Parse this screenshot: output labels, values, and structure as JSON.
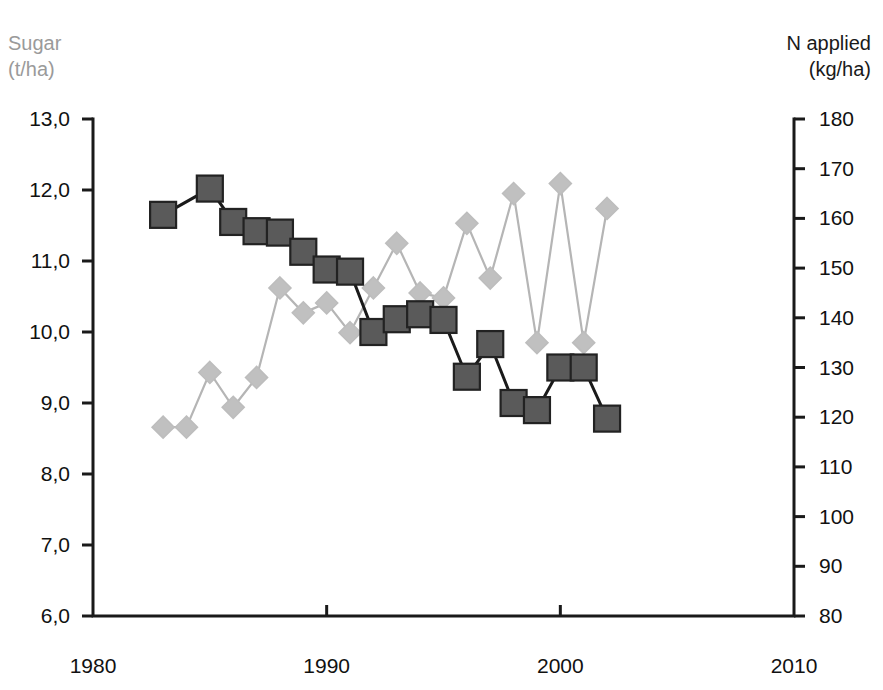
{
  "chart_data": {
    "type": "line",
    "title": "",
    "xlabel": "",
    "xlim": [
      1980,
      2010
    ],
    "x_ticks": [
      "1980",
      "1990",
      "2000",
      "2010"
    ],
    "x_tick_values": [
      1980,
      1990,
      2000,
      2010
    ],
    "grid": false,
    "legend": "none",
    "axes": [
      {
        "id": "left",
        "label_line1": "Sugar",
        "label_line2": "(t/ha)",
        "label_color": "#9a9a9a",
        "ylim": [
          6.0,
          13.0
        ],
        "ticks": [
          "6,0",
          "7,0",
          "8,0",
          "9,0",
          "10,0",
          "11,0",
          "12,0",
          "13,0"
        ],
        "tick_values": [
          6.0,
          7.0,
          8.0,
          9.0,
          10.0,
          11.0,
          12.0,
          13.0
        ]
      },
      {
        "id": "right",
        "label_line1": "N applied",
        "label_line2": "(kg/ha)",
        "label_color": "#1a1a1a",
        "ylim": [
          80,
          180
        ],
        "ticks": [
          "80",
          "90",
          "100",
          "110",
          "120",
          "130",
          "140",
          "150",
          "160",
          "170",
          "180"
        ],
        "tick_values": [
          80,
          90,
          100,
          110,
          120,
          130,
          140,
          150,
          160,
          170,
          180
        ]
      }
    ],
    "series": [
      {
        "name": "Sugar",
        "axis": "left",
        "marker": "square",
        "marker_color": "#5a5a5a",
        "marker_edge": "#222222",
        "line_color": "#1a1a1a",
        "x": [
          1983,
          1985,
          1986,
          1987,
          1988,
          1989,
          1990,
          1991,
          1992,
          1993,
          1994,
          1995,
          1996,
          1997,
          1998,
          1999,
          2000,
          2001,
          2002
        ],
        "values": [
          11.65,
          12.02,
          11.55,
          11.42,
          11.4,
          11.13,
          10.88,
          10.85,
          10.0,
          10.18,
          10.25,
          10.17,
          9.37,
          9.83,
          9.0,
          8.9,
          9.5,
          9.5,
          8.78
        ]
      },
      {
        "name": "N applied",
        "axis": "right",
        "marker": "diamond",
        "marker_color": "#c0c0c0",
        "marker_edge": "#bdbdbd",
        "line_color": "#b5b5b5",
        "x": [
          1983,
          1984,
          1985,
          1986,
          1987,
          1988,
          1989,
          1990,
          1991,
          1992,
          1993,
          1994,
          1995,
          1996,
          1997,
          1998,
          1999,
          2000,
          2001,
          2002
        ],
        "values": [
          118,
          118,
          129,
          122,
          128,
          146,
          141,
          143,
          137,
          146,
          155,
          145,
          144,
          159,
          148,
          165,
          135,
          167,
          135,
          162
        ]
      }
    ]
  },
  "geometry": {
    "plot_left": 93,
    "plot_right": 794,
    "plot_top": 119,
    "plot_bottom": 616,
    "marker_square_size": 26,
    "marker_diamond_size": 22,
    "tick_length": 11,
    "axis_color": "#1a1a1a"
  }
}
